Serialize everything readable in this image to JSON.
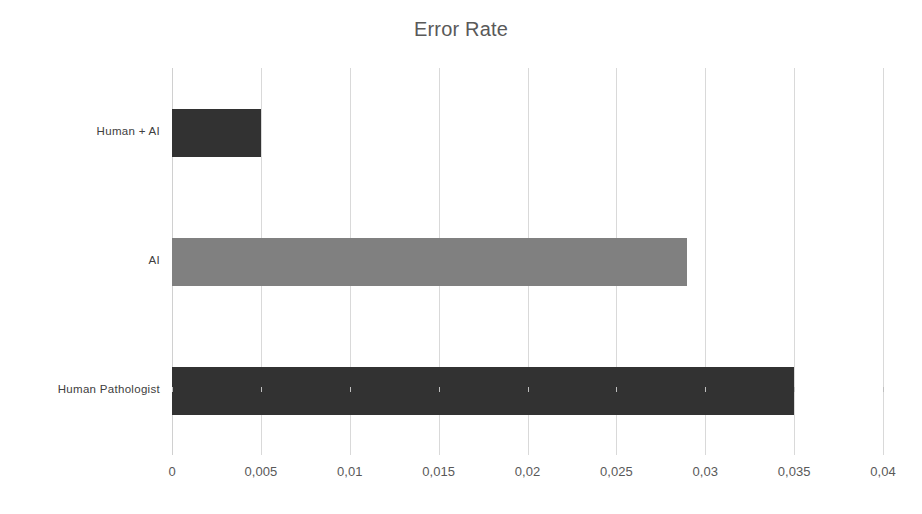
{
  "chart_data": {
    "type": "bar",
    "orientation": "horizontal",
    "title": "Error Rate",
    "xlabel": "",
    "ylabel": "",
    "categories": [
      "Human Pathologist",
      "AI",
      "Human + AI"
    ],
    "values": [
      0.035,
      0.029,
      0.005
    ],
    "bar_colors": [
      "#323232",
      "#808080",
      "#323232"
    ],
    "value_labels": [
      "0,035",
      "0,029",
      "0,005"
    ],
    "xlim": [
      0,
      0.04
    ],
    "xticks": [
      0,
      0.005,
      0.01,
      0.015,
      0.02,
      0.025,
      0.03,
      0.035,
      0.04
    ],
    "xtick_labels": [
      "0",
      "0,005",
      "0,01",
      "0,015",
      "0,02",
      "0,025",
      "0,03",
      "0,035",
      "0,04"
    ],
    "decimal_separator": ",",
    "grid": "vertical",
    "legend": "none",
    "series": [
      {
        "name": "Error Rate",
        "points": [
          {
            "category": "Human Pathologist",
            "value": 0.035,
            "color": "#323232"
          },
          {
            "category": "AI",
            "value": 0.029,
            "color": "#808080"
          },
          {
            "category": "Human + AI",
            "value": 0.005,
            "color": "#323232"
          }
        ]
      }
    ]
  },
  "style": {
    "background": "#ffffff",
    "title_color": "#595959",
    "tick_label_color": "#595959",
    "category_label_color": "#404040",
    "gridline_color": "#d9d9d9"
  }
}
